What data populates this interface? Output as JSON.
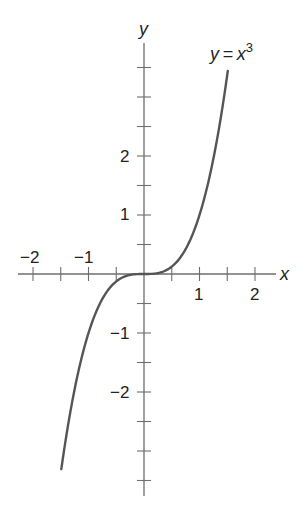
{
  "chart_data": {
    "type": "line",
    "title": "",
    "xlabel": "x",
    "ylabel": "y",
    "xlim": [
      -2.25,
      2.35
    ],
    "ylim": [
      -3.75,
      3.9
    ],
    "grid": false,
    "x_ticks": [
      -2,
      -1.5,
      -1,
      -0.5,
      0.5,
      1,
      1.5,
      2
    ],
    "x_tick_labels": [
      {
        "value": -2,
        "label": "−2"
      },
      {
        "value": -1,
        "label": "−1"
      },
      {
        "value": 1,
        "label": "1"
      },
      {
        "value": 2,
        "label": "2"
      }
    ],
    "y_ticks": [
      -3.5,
      -3,
      -2.5,
      -2,
      -1.5,
      -1,
      -0.5,
      0.5,
      1,
      1.5,
      2,
      2.5,
      3,
      3.5
    ],
    "y_tick_labels": [
      {
        "value": 2,
        "label": "2"
      },
      {
        "value": 1,
        "label": "1"
      },
      {
        "value": -1,
        "label": "−1"
      },
      {
        "value": -2,
        "label": "−2"
      }
    ],
    "series": [
      {
        "name": "y = x^3",
        "function": "x^3",
        "x_range": [
          -1.49,
          1.51
        ],
        "x": [
          -1.49,
          -1.25,
          -1.0,
          -0.75,
          -0.5,
          -0.25,
          0,
          0.25,
          0.5,
          0.75,
          1.0,
          1.25,
          1.51
        ],
        "y": [
          -3.31,
          -1.95,
          -1.0,
          -0.42,
          -0.125,
          -0.016,
          0,
          0.016,
          0.125,
          0.42,
          1.0,
          1.95,
          3.44
        ],
        "color": "#555555"
      }
    ],
    "annotations": [
      {
        "text_main": "y = x",
        "superscript": "3",
        "position": "top-right near curve end"
      }
    ]
  },
  "labels": {
    "x_axis": "x",
    "y_axis": "y",
    "curve_label_main": "y = x",
    "curve_label_sup": "3",
    "x_neg2": "−2",
    "x_neg1": "−1",
    "x_pos1": "1",
    "x_pos2": "2",
    "y_pos2": "2",
    "y_pos1": "1",
    "y_neg1": "−1",
    "y_neg2": "−2"
  }
}
